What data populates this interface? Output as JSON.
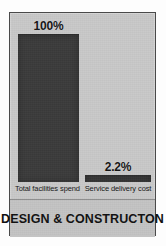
{
  "chart_data": {
    "type": "bar",
    "title": "DESIGN & CONSTRUCTON",
    "xlabel": "",
    "ylabel": "",
    "categories": [
      "Total facilities spend",
      "Service delivery cost"
    ],
    "values": [
      100,
      2.2
    ],
    "value_labels": [
      "100%",
      "2.2%"
    ],
    "ylim": [
      0,
      100
    ],
    "grid": false,
    "legend": "none",
    "units": "percent",
    "colors": {
      "bar_fill": "#3b3b3b",
      "panel_background": "#c9c9c9",
      "title_band_background": "#c4c4c4",
      "panel_border": "#4a4a4a",
      "text": "#111111",
      "page_background": "#ffffff"
    }
  }
}
